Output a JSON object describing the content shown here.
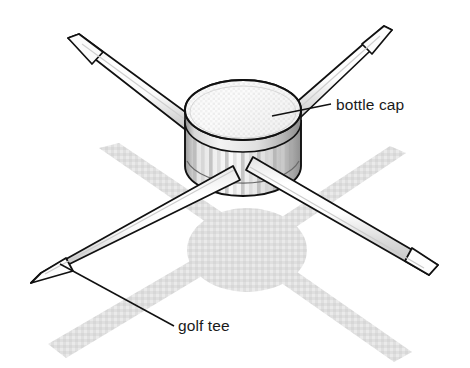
{
  "figure": {
    "background_color": "#ffffff",
    "width": 470,
    "height": 368,
    "outline_color": "#111111",
    "shadow_color": "#dcdcdc",
    "cap_light": "#f2f2f2",
    "cap_mid": "#c9c9c9",
    "cap_dark": "#4a4a4a",
    "tee_light": "#ffffff",
    "tee_mid": "#d5d5d5"
  },
  "labels": [
    {
      "id": "bottle-cap",
      "text": "bottle cap",
      "x": 336,
      "y": 110,
      "leader": {
        "x1": 272,
        "y1": 116,
        "x2": 331,
        "y2": 104
      }
    },
    {
      "id": "golf-tee",
      "text": "golf tee",
      "x": 178,
      "y": 331,
      "leader": {
        "x1": 60,
        "y1": 264,
        "x2": 174,
        "y2": 326
      }
    }
  ],
  "parts": {
    "bottle_cap": {
      "name": "bottle cap",
      "shape": "ribbed cylinder with elliptical top",
      "rib_count": 13,
      "center_x": 243,
      "center_y": 120,
      "radius_x": 58,
      "radius_y": 30,
      "body_height": 62
    },
    "golf_tees": [
      {
        "name": "tee-upper-left",
        "tip_x": 68,
        "tip_y": 38,
        "angle_deg": 26
      },
      {
        "name": "tee-upper-right",
        "tip_x": 392,
        "tip_y": 30,
        "angle_deg": -25
      },
      {
        "name": "tee-lower-left",
        "tip_x": 31,
        "tip_y": 283,
        "angle_deg": -28
      },
      {
        "name": "tee-lower-right",
        "tip_x": 438,
        "tip_y": 265,
        "angle_deg": 27
      }
    ],
    "shadow": {
      "name": "cast shadow",
      "shape": "four-armed X with circular center",
      "center_x": 247,
      "center_y": 250
    }
  }
}
